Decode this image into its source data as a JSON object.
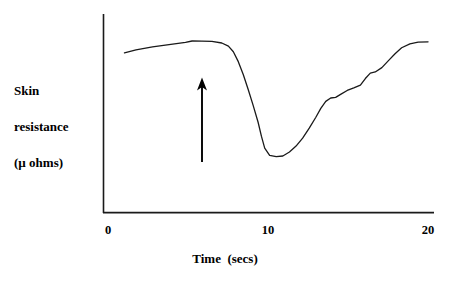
{
  "chart_data": {
    "type": "line",
    "title": "",
    "subtitle": "",
    "xlabel": "Time  (secs)",
    "ylabel": "Skin resistance (µ ohms)",
    "ylabel_lines": [
      "Skin",
      "resistance",
      "(µ ohms)"
    ],
    "xlim": [
      0,
      20
    ],
    "ylim": [
      0,
      100
    ],
    "xticks": [
      0,
      10,
      20
    ],
    "xtick_labels": [
      "0",
      "10",
      "20"
    ],
    "yticks": [],
    "ytick_labels": [],
    "grid": false,
    "legend": null,
    "axis_style": "left-and-bottom-spines-only",
    "line_color": "#1a1a1a",
    "line_width": 1.3,
    "series": [
      {
        "name": "Skin resistance",
        "x": [
          1.3,
          2.0,
          3.0,
          4.0,
          5.0,
          5.4,
          6.0,
          6.6,
          7.2,
          7.6,
          7.9,
          8.2,
          8.5,
          8.8,
          9.1,
          9.4,
          9.6,
          9.8,
          10.1,
          10.5,
          10.9,
          11.3,
          11.7,
          12.1,
          12.5,
          12.9,
          13.2,
          13.5,
          13.8,
          14.1,
          14.4,
          14.8,
          15.2,
          15.6,
          15.9,
          16.2,
          16.5,
          16.9,
          17.3,
          17.7,
          18.1,
          18.6,
          19.1,
          19.7
        ],
        "y": [
          80.4,
          81.9,
          83.4,
          84.6,
          85.7,
          86.4,
          86.3,
          86.2,
          85.4,
          83.8,
          81.0,
          76.0,
          69.5,
          62.0,
          54.0,
          45.5,
          38.5,
          32.5,
          28.8,
          28.2,
          28.5,
          30.5,
          33.5,
          37.5,
          42.5,
          48.0,
          52.5,
          56.0,
          57.7,
          58.0,
          59.5,
          61.5,
          62.8,
          64.2,
          67.5,
          70.2,
          70.8,
          73.0,
          76.5,
          80.0,
          83.0,
          85.0,
          85.8,
          86.0
        ]
      }
    ],
    "annotations": [
      {
        "type": "arrow",
        "name": "stimulus-marker",
        "direction": "up",
        "x": 6.0,
        "y_tail": 25.5,
        "y_head": 68.0,
        "label": "",
        "color": "#000000"
      }
    ]
  },
  "axes": {
    "x_tick_0": "0",
    "x_tick_10": "10",
    "x_tick_20": "20",
    "x_axis_title": "Time  (secs)"
  },
  "y_axis_caption": {
    "line1": "Skin",
    "line2": "resistance",
    "line3": "(µ ohms)"
  }
}
